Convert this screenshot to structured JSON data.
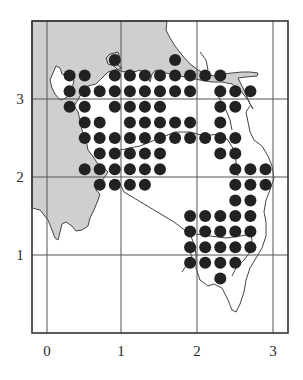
{
  "chart_data": {
    "type": "scatter",
    "title": "",
    "xlabel": "",
    "ylabel": "",
    "x_ticks": [
      "0",
      "1",
      "2",
      "3"
    ],
    "y_ticks": [
      "1",
      "2",
      "3"
    ],
    "xlim": [
      -0.2,
      3.2
    ],
    "ylim": [
      0,
      4.0
    ],
    "grid": true,
    "marker": "filled-circle",
    "colors": {
      "dots": "#222222",
      "land": "#cfcfcf",
      "coast": "#444444",
      "grid": "#555555",
      "frame": "#333333"
    },
    "rows": [
      {
        "y": 3.5,
        "x": [
          0.9,
          1.7
        ]
      },
      {
        "y": 3.3,
        "x": [
          0.3,
          0.5,
          0.9,
          1.1,
          1.3,
          1.5,
          1.7,
          1.9,
          2.1,
          2.3
        ]
      },
      {
        "y": 3.1,
        "x": [
          0.3,
          0.5,
          0.7,
          0.9,
          1.1,
          1.3,
          1.5,
          1.7,
          1.9,
          2.3,
          2.5,
          2.7
        ]
      },
      {
        "y": 2.9,
        "x": [
          0.3,
          0.5,
          0.9,
          1.1,
          1.3,
          1.5,
          2.3,
          2.5
        ]
      },
      {
        "y": 2.7,
        "x": [
          0.5,
          0.7,
          1.1,
          1.3,
          1.5,
          1.7,
          1.9,
          2.3
        ]
      },
      {
        "y": 2.5,
        "x": [
          0.5,
          0.7,
          0.9,
          1.1,
          1.3,
          1.5,
          1.7,
          1.9,
          2.1,
          2.3,
          2.5
        ]
      },
      {
        "y": 2.3,
        "x": [
          0.7,
          0.9,
          1.1,
          1.3,
          1.5,
          2.3,
          2.5
        ]
      },
      {
        "y": 2.1,
        "x": [
          0.5,
          0.7,
          0.9,
          1.1,
          1.3,
          1.5,
          2.5,
          2.7,
          2.9
        ]
      },
      {
        "y": 1.9,
        "x": [
          0.7,
          0.9,
          1.1,
          1.3,
          2.5,
          2.7,
          2.9
        ]
      },
      {
        "y": 1.7,
        "x": [
          2.5,
          2.7
        ]
      },
      {
        "y": 1.5,
        "x": [
          1.9,
          2.1,
          2.3,
          2.5,
          2.7
        ]
      },
      {
        "y": 1.3,
        "x": [
          1.9,
          2.1,
          2.3,
          2.5,
          2.7
        ]
      },
      {
        "y": 1.1,
        "x": [
          1.9,
          2.1,
          2.3,
          2.5,
          2.7
        ]
      },
      {
        "y": 0.9,
        "x": [
          1.9,
          2.1,
          2.3,
          2.5
        ]
      },
      {
        "y": 0.7,
        "x": [
          2.3
        ]
      }
    ]
  },
  "axes": {
    "x_labels": [
      "0",
      "1",
      "2",
      "3"
    ],
    "y_labels": [
      "3",
      "2",
      "1"
    ]
  }
}
